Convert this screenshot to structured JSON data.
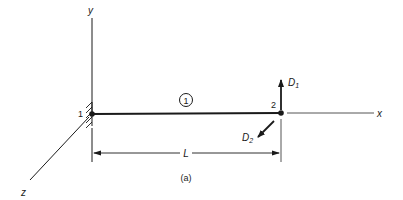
{
  "figure": {
    "caption": "(a)",
    "axes": {
      "x_label": "x",
      "y_label": "y",
      "z_label": "z"
    },
    "nodes": [
      {
        "label": "1",
        "support": "fixed-wall"
      },
      {
        "label": "2",
        "support": "free"
      }
    ],
    "element": {
      "label": "1"
    },
    "dimension": {
      "label": "L"
    },
    "dofs": [
      {
        "name": "D",
        "subscript": "1",
        "direction": "up (y)"
      },
      {
        "name": "D",
        "subscript": "2",
        "direction": "out of plane (z)"
      }
    ],
    "colors": {
      "line": "#1a1a1a",
      "thin_line": "#555555"
    }
  }
}
